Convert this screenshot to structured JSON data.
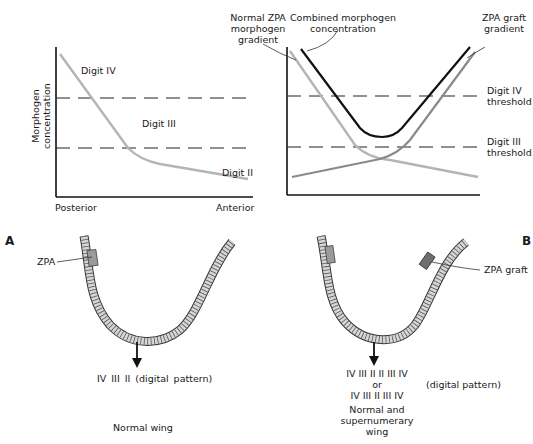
{
  "panel_a": {
    "letter": "A",
    "graph": {
      "ylabel_line1": "Morphogen",
      "ylabel_line2": "concentration",
      "xlabel_left": "Posterior",
      "xlabel_right": "Anterior",
      "region_labels": [
        "Digit IV",
        "Digit III",
        "Digit II"
      ]
    },
    "wing": {
      "zpa_label": "ZPA",
      "digital_pattern": "IV   III  II  (digital pattern)",
      "caption": "Normal wing"
    }
  },
  "panel_b": {
    "letter": "B",
    "graph": {
      "annotations": {
        "normal_zpa": [
          "Normal ZPA",
          "morphogen",
          "gradient"
        ],
        "combined": [
          "Combined morphogen",
          "concentration"
        ],
        "graft": [
          "ZPA graft",
          "gradient"
        ],
        "digit_iv_threshold": [
          "Digit IV",
          "threshold"
        ],
        "digit_iii_threshold": [
          "Digit III",
          "threshold"
        ]
      }
    },
    "wing": {
      "zpa_graft_label": "ZPA graft",
      "pattern_line1": "IV  III  II  II  III  IV",
      "pattern_or": "or",
      "pattern_line2": "IV  III  II    III  IV",
      "pattern_suffix": "(digital pattern)",
      "caption_lines": [
        "Normal and",
        "supernumerary",
        "wing"
      ]
    }
  },
  "colors": {
    "axis": "#111111",
    "normal_gradient": "#b4b4b4",
    "graft_gradient": "#8a8a8a",
    "combined": "#111111",
    "wing_fill": "#d6d6d6",
    "zpa_fill": "#9a9a9a",
    "graft_fill": "#6e6e6e"
  }
}
